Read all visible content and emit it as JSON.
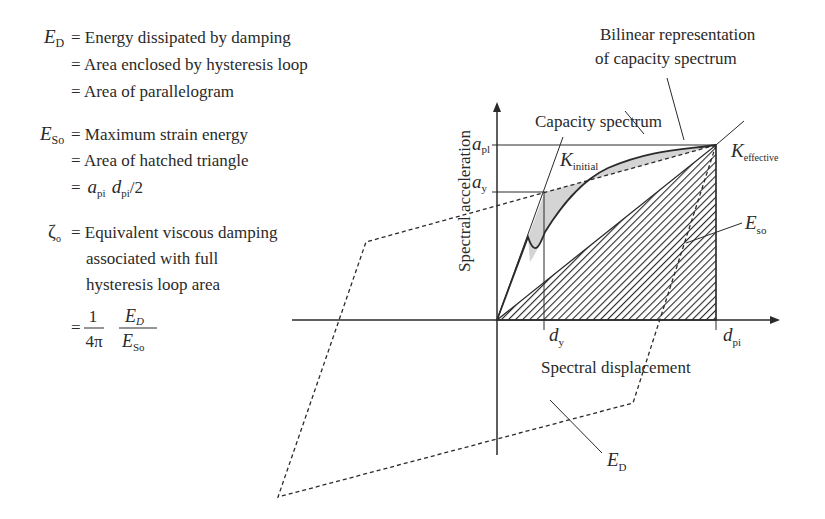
{
  "definitions": {
    "ed": {
      "symbol": "E",
      "subscript": "D",
      "lines": [
        "= Energy dissipated by damping",
        "= Area enclosed by hysteresis loop",
        "= Area of parallelogram"
      ]
    },
    "eso": {
      "symbol": "E",
      "subscript": "So",
      "lines": [
        "= Maximum strain energy",
        "= Area of hatched triangle"
      ],
      "formula": {
        "prefix": "=",
        "a": "a",
        "a_sub": "pi",
        "d": "d",
        "d_sub": "pi",
        "suffix": "/2"
      }
    },
    "zeta": {
      "symbol": "ζ",
      "subscript": "o",
      "lines": [
        "= Equivalent viscous damping",
        "associated with full",
        "hysteresis loop area"
      ],
      "formula": {
        "prefix": "=",
        "num1": "1",
        "den1": "4π",
        "num2": "E",
        "num2_sub": "D",
        "den2": "E",
        "den2_sub": "So"
      }
    }
  },
  "diagram": {
    "title_bilinear": [
      "Bilinear representation",
      "of capacity spectrum"
    ],
    "label_capacity": "Capacity spectrum",
    "axis_y": "Spectral acceleration",
    "axis_x": "Spectral displacement",
    "labels": {
      "a_pl": {
        "main": "a",
        "sub": "pl"
      },
      "a_y": {
        "main": "a",
        "sub": "y"
      },
      "d_y": {
        "main": "d",
        "sub": "y"
      },
      "d_pi": {
        "main": "d",
        "sub": "pi"
      },
      "k_initial": {
        "main": "K",
        "sub": "initial"
      },
      "k_effective": {
        "main": "K",
        "sub": "effective"
      },
      "e_so": {
        "main": "E",
        "sub": "so"
      },
      "e_d": {
        "main": "E",
        "sub": "D"
      }
    },
    "colors": {
      "line": "#2a2a2a",
      "shade": "#d4d4d4",
      "background": "#ffffff"
    }
  }
}
